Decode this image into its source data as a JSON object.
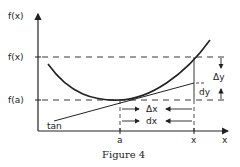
{
  "figure": {
    "caption": "Figure 4",
    "y_axis_label": "f(x)",
    "x_axis_label": "x",
    "y_ticks": [
      {
        "label": "f(x)",
        "y": 57
      },
      {
        "label": "f(a)",
        "y": 100
      }
    ],
    "x_ticks": [
      {
        "label": "a",
        "x": 120
      },
      {
        "label": "x",
        "x": 194
      }
    ],
    "annotations": {
      "tangent": "tan",
      "delta_x": "Δx",
      "dx": "dx",
      "delta_y": "Δy",
      "dy": "dy"
    },
    "colors": {
      "line": "#222222",
      "background": "#ffffff"
    }
  }
}
